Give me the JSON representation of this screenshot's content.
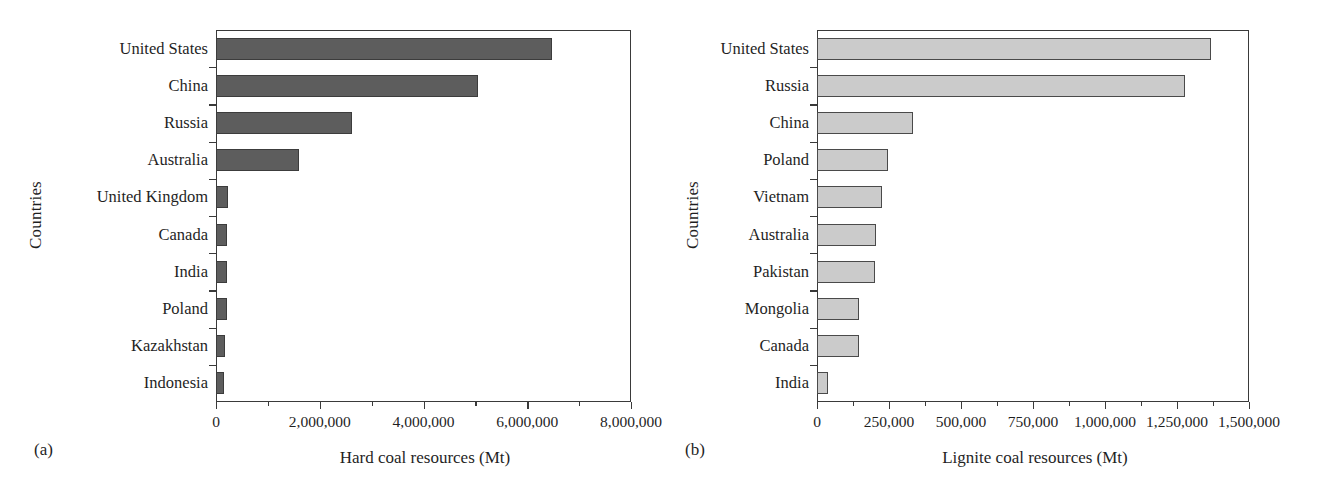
{
  "figure": {
    "panels": [
      {
        "tag": "(a)",
        "ylabel": "Countries",
        "xlabel": "Hard coal resources (Mt)"
      },
      {
        "tag": "(b)",
        "ylabel": "Countries",
        "xlabel": "Lignite coal resources (Mt)"
      }
    ]
  },
  "chart_data": [
    {
      "type": "bar",
      "orientation": "horizontal",
      "panel": "(a)",
      "title": "",
      "xlabel": "Hard coal resources (Mt)",
      "ylabel": "Countries",
      "xlim": [
        0,
        8000000
      ],
      "xticks": [
        0,
        2000000,
        4000000,
        6000000,
        8000000
      ],
      "xtick_labels": [
        "0",
        "2,000,000",
        "4,000,000",
        "6,000,000",
        "8,000,000"
      ],
      "minor_tick_interval": 1000000,
      "grid": false,
      "legend": false,
      "bar_color": "#5d5d5d",
      "categories": [
        "United States",
        "China",
        "Russia",
        "Australia",
        "United Kingdom",
        "Canada",
        "India",
        "Poland",
        "Kazakhstan",
        "Indonesia"
      ],
      "values": [
        6477000,
        5053000,
        2620000,
        1595000,
        228000,
        210000,
        208000,
        205000,
        170000,
        150000
      ]
    },
    {
      "type": "bar",
      "orientation": "horizontal",
      "panel": "(b)",
      "title": "",
      "xlabel": "Lignite coal resources (Mt)",
      "ylabel": "Countries",
      "xlim": [
        0,
        1500000
      ],
      "xticks": [
        0,
        250000,
        500000,
        750000,
        1000000,
        1250000,
        1500000
      ],
      "xtick_labels": [
        "0",
        "250,000",
        "500,000",
        "750,000",
        "1,000,000",
        "1,250,000",
        "1,500,000"
      ],
      "minor_tick_interval": 125000,
      "grid": false,
      "legend": false,
      "bar_color": "#cbcbcb",
      "categories": [
        "United States",
        "Russia",
        "China",
        "Poland",
        "Vietnam",
        "Australia",
        "Pakistan",
        "Mongolia",
        "Canada",
        "India"
      ],
      "values": [
        1368000,
        1278000,
        333000,
        247000,
        226000,
        205000,
        201000,
        146000,
        146000,
        38000
      ]
    }
  ]
}
